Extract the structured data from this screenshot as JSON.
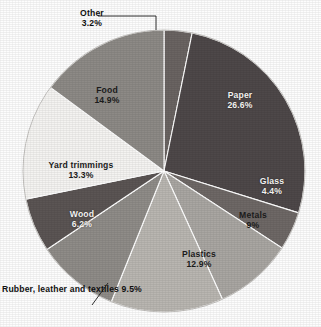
{
  "chart_data": {
    "type": "pie",
    "title": "",
    "subtitle": "",
    "xlabel": "",
    "ylabel": "",
    "legend_position": "none",
    "grid": false,
    "start_angle_deg": 0,
    "direction": "clockwise",
    "units": "percent",
    "categories": [
      "Other",
      "Paper",
      "Glass",
      "Metals",
      "Plastics",
      "Rubber, leather and textiles",
      "Wood",
      "Yard trimmings",
      "Food"
    ],
    "values": [
      3.2,
      26.6,
      4.4,
      9,
      12.9,
      9.5,
      6.2,
      13.3,
      14.9
    ],
    "slices": [
      {
        "name": "Other",
        "value": 3.2,
        "label_name": "Other",
        "label_value": "3.2%",
        "color": "#6a6462",
        "label_placement": "outside",
        "leader_line": true
      },
      {
        "name": "Paper",
        "value": 26.6,
        "label_name": "Paper",
        "label_value": "26.6%",
        "color": "#4e4849",
        "label_placement": "inside",
        "leader_line": false
      },
      {
        "name": "Glass",
        "value": 4.4,
        "label_name": "Glass",
        "label_value": "4.4%",
        "color": "#6e6866",
        "label_placement": "inside",
        "leader_line": false
      },
      {
        "name": "Metals",
        "value": 9,
        "label_name": "Metals",
        "label_value": "9%",
        "color": "#a9a6a2",
        "label_placement": "inside",
        "leader_line": false
      },
      {
        "name": "Plastics",
        "value": 12.9,
        "label_name": "Plastics",
        "label_value": "12.9%",
        "color": "#b9b6b1",
        "label_placement": "inside",
        "leader_line": false
      },
      {
        "name": "Rubber, leather and textiles",
        "value": 9.5,
        "label_name": "Rubber, leather and",
        "label_value": "textiles 9.5%",
        "color": "#8f8c88",
        "label_placement": "outside",
        "leader_line": true
      },
      {
        "name": "Wood",
        "value": 6.2,
        "label_name": "Wood",
        "label_value": "6.2%",
        "color": "#5b5554",
        "label_placement": "inside",
        "leader_line": false
      },
      {
        "name": "Yard trimmings",
        "value": 13.3,
        "label_name": "Yard trimmings",
        "label_value": "13.3%",
        "color": "#f4f3f1",
        "label_placement": "inside",
        "leader_line": false
      },
      {
        "name": "Food",
        "value": 14.9,
        "label_name": "Food",
        "label_value": "14.9%",
        "color": "#8d8a86",
        "label_placement": "inside",
        "leader_line": false
      }
    ]
  }
}
